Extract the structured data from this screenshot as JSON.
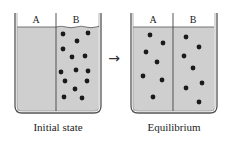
{
  "diagram": {
    "arrow": "→",
    "colors": {
      "liquid": "#cfcfcf",
      "container": "#555555",
      "particle": "#1a1a1a",
      "text": "#222222"
    },
    "beakers": [
      {
        "caption": "Initial state",
        "compartments": [
          {
            "label": "A",
            "particles": []
          },
          {
            "label": "B",
            "particles": 14
          }
        ]
      },
      {
        "caption": "Equilibrium",
        "compartments": [
          {
            "label": "A",
            "particles": 7
          },
          {
            "label": "B",
            "particles": 7
          }
        ]
      }
    ]
  }
}
